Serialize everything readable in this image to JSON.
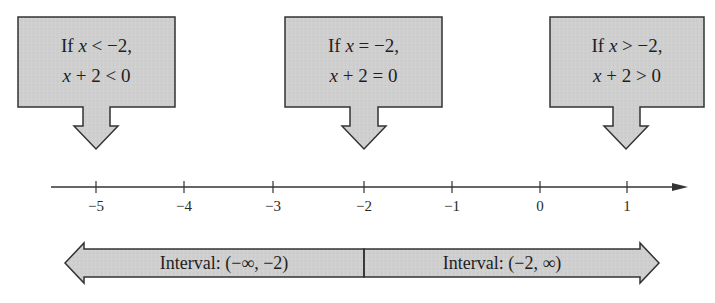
{
  "diagram": {
    "colors": {
      "box_fill": "#cfcfcf",
      "stroke": "#333333",
      "background": "#ffffff"
    },
    "cases": [
      {
        "id": "less",
        "line1_prefix": "If ",
        "line1_var": "x",
        "line1_rest": " < −2,",
        "line2_var": "x",
        "line2_rest": " + 2 < 0",
        "points_to": -5
      },
      {
        "id": "equal",
        "line1_prefix": "If ",
        "line1_var": "x",
        "line1_rest": " = −2,",
        "line2_var": "x",
        "line2_rest": " + 2 = 0",
        "points_to": -2
      },
      {
        "id": "greater",
        "line1_prefix": "If ",
        "line1_var": "x",
        "line1_rest": " > −2,",
        "line2_var": "x",
        "line2_rest": " + 2 > 0",
        "points_to": 1
      }
    ],
    "number_line": {
      "ticks": [
        "−5",
        "−4",
        "−3",
        "−2",
        "−1",
        "0",
        "1"
      ],
      "tick_values": [
        -5,
        -4,
        -3,
        -2,
        -1,
        0,
        1
      ]
    },
    "intervals": [
      {
        "label": "Interval: (−∞, −2)",
        "direction": "left"
      },
      {
        "label": "Interval: (−2, ∞)",
        "direction": "right"
      }
    ]
  }
}
